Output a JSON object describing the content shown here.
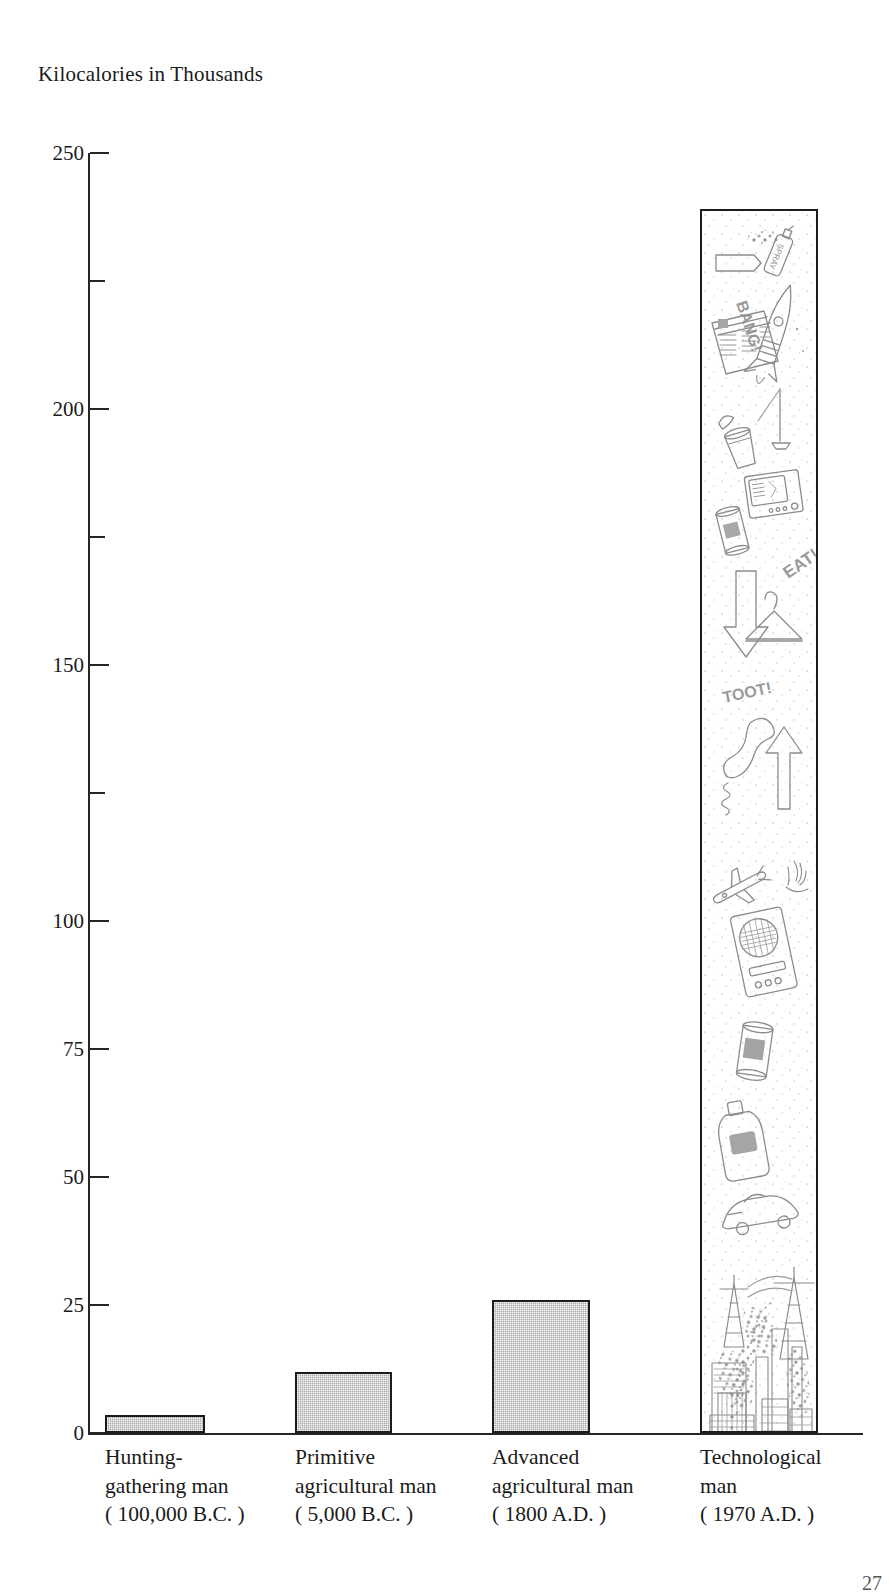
{
  "figure": {
    "axis_title": "Kilocalories in Thousands",
    "page_number": "27"
  },
  "chart_data": {
    "type": "bar",
    "title": "Kilocalories in Thousands",
    "xlabel": "",
    "ylabel": "Kilocalories in Thousands",
    "ylim": [
      0,
      250
    ],
    "grid": false,
    "legend": "none",
    "categories": [
      "Hunting-gathering man (100,000 B.C.)",
      "Primitive agricultural man (5,000 B.C.)",
      "Advanced agricultural man (1800 A.D.)",
      "Technological man (1970 A.D.)"
    ],
    "values": [
      3.5,
      12,
      26,
      239
    ],
    "bar_style": [
      "stippled-gray",
      "stippled-gray",
      "stippled-gray",
      "illustrated"
    ],
    "y_ticks_major": [
      0,
      25,
      50,
      75,
      100,
      150,
      200,
      250
    ],
    "y_ticks_minor": [
      125,
      175,
      225
    ],
    "y_tick_labels": [
      "0",
      "25",
      "50",
      "75",
      "100",
      "150",
      "200",
      "250"
    ]
  },
  "y_axis": {
    "ticks": [
      {
        "value": 250,
        "label": "250",
        "minor": false
      },
      {
        "value": 225,
        "label": "",
        "minor": true
      },
      {
        "value": 200,
        "label": "200",
        "minor": false
      },
      {
        "value": 175,
        "label": "",
        "minor": true
      },
      {
        "value": 150,
        "label": "150",
        "minor": false
      },
      {
        "value": 125,
        "label": "",
        "minor": true
      },
      {
        "value": 100,
        "label": "100",
        "minor": false
      },
      {
        "value": 75,
        "label": "75",
        "minor": false
      },
      {
        "value": 50,
        "label": "50",
        "minor": false
      },
      {
        "value": 25,
        "label": "25",
        "minor": false
      },
      {
        "value": 0,
        "label": "0",
        "minor": false
      }
    ]
  },
  "bars": [
    {
      "id": "hunting-gathering-man",
      "value": 3.5,
      "label_lines": [
        "Hunting-",
        "gathering man",
        "( 100,000 B.C. )"
      ],
      "name": "Hunting-gathering man",
      "period": "( 100,000 B.C. )"
    },
    {
      "id": "primitive-agricultural-man",
      "value": 12,
      "label_lines": [
        "Primitive",
        "agricultural man",
        "( 5,000 B.C. )"
      ],
      "name": "Primitive agricultural man",
      "period": "( 5,000 B.C. )"
    },
    {
      "id": "advanced-agricultural-man",
      "value": 26,
      "label_lines": [
        "Advanced",
        "agricultural man",
        "( 1800 A.D. )"
      ],
      "name": "Advanced agricultural man",
      "period": "( 1800 A.D. )"
    },
    {
      "id": "technological-man",
      "value": 239,
      "label_lines": [
        "Technological",
        "man",
        "( 1970 A.D. )"
      ],
      "name": "Technological man",
      "period": "( 1970 A.D. )"
    }
  ],
  "illustration": {
    "description": "Line-drawing collage of consumer and industrial technology rising as a tall column",
    "word_balloons": [
      "SPRAY",
      "BANG!",
      "EAT!",
      "TOOT!",
      "TV"
    ],
    "items": [
      "spray-can",
      "rocket",
      "newspaper",
      "paper-cup",
      "television",
      "soda-can",
      "down-arrow",
      "coat-hanger",
      "telephone-handset",
      "up-arrow",
      "airplane",
      "transistor-radio",
      "tin-can",
      "detergent-bottle",
      "automobile",
      "power-transmission-tower",
      "smoke-plume",
      "factory-smokestack",
      "city-buildings"
    ]
  },
  "colors": {
    "bar_fill": "#a9a9a9",
    "bar_stroke": "#1c1c1c",
    "axis": "#262626",
    "text": "#1a1a1a",
    "background": "#ffffff",
    "illustration_line": "#8a8a8a"
  }
}
